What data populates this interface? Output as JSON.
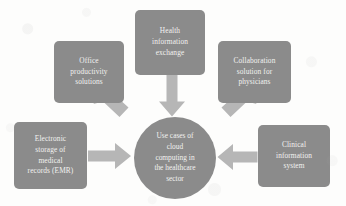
{
  "diagram": {
    "type": "hub-and-spoke",
    "center": {
      "id": "use-cases-hub",
      "label": "Use cases of\ncloud\ncomputing in\nthe healthcare\nsector",
      "shape": "circle",
      "fill": "#8b8b8b",
      "text_color": "#f2f2f0"
    },
    "nodes": [
      {
        "id": "health-information-exchange",
        "label": "Health\ninformation\nexchange",
        "shape": "rounded-rectangle",
        "position": "top-center",
        "fill": "#8b8b8b",
        "text_color": "#f2f2f0"
      },
      {
        "id": "office-productivity-solutions",
        "label": "Office\nproductivity\nsolutions",
        "shape": "rounded-rectangle",
        "position": "top-left",
        "fill": "#8b8b8b",
        "text_color": "#f2f2f0"
      },
      {
        "id": "collaboration-solution-for-physicians",
        "label": "Collaboration\nsolution for\nphysicians",
        "shape": "rounded-rectangle",
        "position": "top-right",
        "fill": "#8b8b8b",
        "text_color": "#f2f2f0"
      },
      {
        "id": "electronic-storage-of-medical-records",
        "label": "Electronic\nstorage of\nmedical\nrecords (EMR)",
        "shape": "rounded-rectangle",
        "position": "left",
        "fill": "#8b8b8b",
        "text_color": "#f2f2f0"
      },
      {
        "id": "clinical-information-system",
        "label": "Clinical\ninformation\nsystem",
        "shape": "rounded-rectangle",
        "position": "right",
        "fill": "#8b8b8b",
        "text_color": "#f2f2f0"
      }
    ],
    "arrows": [
      {
        "id": "arrow-office-to-hub",
        "from": "office-productivity-solutions",
        "to": "use-cases-hub",
        "direction": "down-right",
        "fill": "#b6b6b6"
      },
      {
        "id": "arrow-health-to-hub",
        "from": "health-information-exchange",
        "to": "use-cases-hub",
        "direction": "down",
        "fill": "#b6b6b6"
      },
      {
        "id": "arrow-collab-to-hub",
        "from": "collaboration-solution-for-physicians",
        "to": "use-cases-hub",
        "direction": "down-left",
        "fill": "#b6b6b6"
      },
      {
        "id": "arrow-emr-to-hub",
        "from": "electronic-storage-of-medical-records",
        "to": "use-cases-hub",
        "direction": "right",
        "fill": "#b6b6b6"
      },
      {
        "id": "arrow-clinical-to-hub",
        "from": "clinical-information-system",
        "to": "use-cases-hub",
        "direction": "left",
        "fill": "#b6b6b6"
      }
    ],
    "colors": {
      "background": "#fdfdfc",
      "node_fill": "#8b8b8b",
      "arrow_fill": "#b6b6b6",
      "node_text": "#f2f2f0"
    }
  }
}
